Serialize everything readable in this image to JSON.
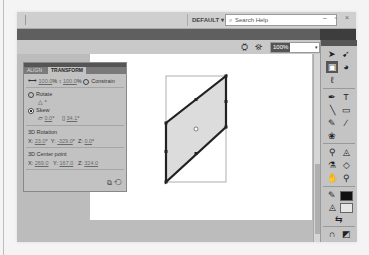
{
  "titlebar": {
    "workspace_label": "DEFAULT",
    "workspace_arrow": "▾",
    "search_placeholder": "Search Help",
    "search_icon": "⌕",
    "window_buttons": "– ▫ ×"
  },
  "toolbar": {
    "edit_symbols_icon": "⛭",
    "edit_scene_icon": "⛯",
    "zoom_value": "100%",
    "zoom_arrow": "▾"
  },
  "transform_panel": {
    "tabs": [
      {
        "label": "ALIGN"
      },
      {
        "label": "TRANSFORM"
      }
    ],
    "width_value": "100.0",
    "width_unit": "%",
    "height_value": "100.0",
    "height_unit": "%",
    "constrain_label": "Constrain",
    "rotate_label": "Rotate",
    "rotate_value": "",
    "rotate_unit": "°",
    "skew_label": "Skew",
    "skew_h_value": "0.0",
    "skew_v_value": "34.1",
    "deg": "°",
    "rotation3d_title": "3D Rotation",
    "rot_x_label": "X:",
    "rot_x": "23.0",
    "rot_y_label": "Y:",
    "rot_y": "-329.0",
    "rot_z_label": "Z:",
    "rot_z": "0.0",
    "center3d_title": "3D Center point",
    "c_x_label": "X:",
    "c_x": "269.0",
    "c_y_label": "Y:",
    "c_y": "167.0",
    "c_z_label": "Z:",
    "c_z": "324.0",
    "duplicate_icon": "⧉",
    "reset_icon": "⟲"
  },
  "tools": {
    "selection": "➤",
    "subselection": "➹",
    "free_transform": "▣",
    "3d_rotation": "◕",
    "lasso": "ℓ",
    "pen": "✒",
    "text": "T",
    "line": "╲",
    "rectangle": "▭",
    "pencil": "✎",
    "brush": "∕",
    "deco": "❀",
    "bone": "⚲",
    "paint_bucket": "◬",
    "eyedropper": "⚗",
    "eraser": "◇",
    "hand": "✋",
    "zoom": "⚲",
    "stroke_icon": "✎",
    "fill_icon": "◬",
    "swap_colors": "⇆",
    "snap": "∩",
    "smooth": "◩",
    "straighten": "◪",
    "option4": "◫",
    "option5": "◘",
    "colors": {
      "stroke": "#111111",
      "fill": "#e6e6e6"
    }
  }
}
